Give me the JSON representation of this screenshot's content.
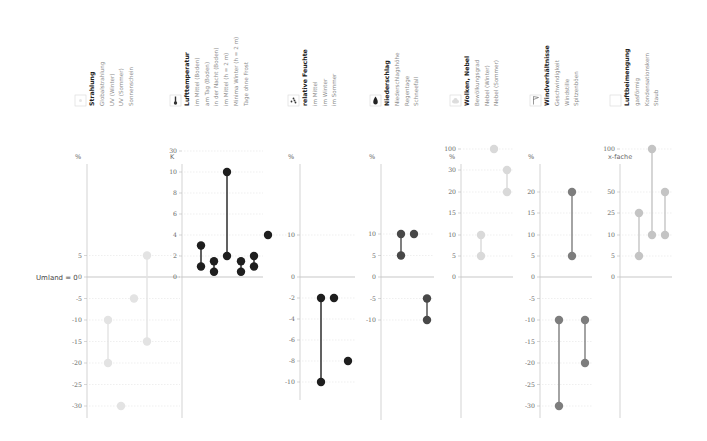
{
  "chart_data": {
    "type": "scatter",
    "baseline_label": "Umland = 0",
    "panels": [
      {
        "id": "strahlung",
        "title": "Strahlung",
        "icon": "sun-icon",
        "unit": "%",
        "color": "#e3e3e3",
        "items": [
          "Globalstrahlung",
          "UV (Winter)",
          "UV (Sommer)",
          "Sonnenschein"
        ],
        "ticks": [
          "5",
          "0",
          "-5",
          "-10",
          "-15",
          "-20",
          "-25",
          "-30"
        ],
        "tick_values": [
          5,
          0,
          -5,
          -10,
          -15,
          -20,
          -25,
          -30
        ],
        "series": [
          {
            "name": "Globalstrahlung",
            "min": -20,
            "max": -10
          },
          {
            "name": "UV (Winter)",
            "min": -30,
            "max": -30
          },
          {
            "name": "UV (Sommer)",
            "min": -5,
            "max": -5
          },
          {
            "name": "Sonnenschein",
            "min": -15,
            "max": 5
          }
        ]
      },
      {
        "id": "lufttemperatur",
        "title": "Lufttemperatur",
        "icon": "thermometer-icon",
        "unit": "K",
        "color": "#1e1e1e",
        "items": [
          "im Mittel (Boden)",
          "am Tag (Boden)",
          "in der Nacht (Boden)",
          "im Mittel (h = 2 m)",
          "Minima Winter (h = 2 m)",
          "Tage ohne Frost"
        ],
        "ticks": [
          "30",
          "10",
          "8",
          "6",
          "4",
          "2",
          "0"
        ],
        "tick_values": [
          30,
          10,
          8,
          6,
          4,
          2,
          0
        ],
        "series": [
          {
            "name": "im Mittel (Boden)",
            "min": 1,
            "max": 3
          },
          {
            "name": "am Tag (Boden)",
            "min": 0.5,
            "max": 1.5
          },
          {
            "name": "in der Nacht (Boden)",
            "min": 2,
            "max": 10
          },
          {
            "name": "im Mittel (h = 2 m)",
            "min": 0.5,
            "max": 1.5
          },
          {
            "name": "Minima Winter (h = 2 m)",
            "min": 1,
            "max": 2
          },
          {
            "name": "Tage ohne Frost (%)",
            "min": 10,
            "max": 10
          }
        ]
      },
      {
        "id": "relative-feuchte",
        "title": "relative Feuchte",
        "icon": "droplets-icon",
        "unit": "%",
        "color": "#1e1e1e",
        "items": [
          "im Mittel",
          "im Winter",
          "im Sommer"
        ],
        "ticks": [
          "10",
          "0",
          "-2",
          "-4",
          "-6",
          "-8",
          "-10"
        ],
        "tick_values": [
          10,
          0,
          -2,
          -4,
          -6,
          -8,
          -10
        ],
        "series": [
          {
            "name": "im Mittel",
            "min": -10,
            "max": -2
          },
          {
            "name": "im Winter",
            "min": -2,
            "max": -2
          },
          {
            "name": "im Sommer",
            "min": -8,
            "max": -8
          }
        ]
      },
      {
        "id": "niederschlag",
        "title": "Niederschlag",
        "icon": "raindrop-icon",
        "unit": "%",
        "color": "#484848",
        "items": [
          "Niederschlagshöhe",
          "Regentage",
          "Schneefall"
        ],
        "ticks": [
          "10",
          "5",
          "0",
          "-5",
          "-10"
        ],
        "tick_values": [
          10,
          5,
          0,
          -5,
          -10
        ],
        "series": [
          {
            "name": "Niederschlagshöhe",
            "min": 5,
            "max": 10
          },
          {
            "name": "Regentage",
            "min": 10,
            "max": 10
          },
          {
            "name": "Schneefall",
            "min": -10,
            "max": -5
          }
        ]
      },
      {
        "id": "wolken-nebel",
        "title": "Wolken, Nebel",
        "icon": "cloud-icon",
        "unit": "%",
        "color": "#d9d9d9",
        "items": [
          "Bewölkungsgrad",
          "Nebel (Winter)",
          "Nebel (Sommer)"
        ],
        "ticks": [
          "100",
          "30",
          "20",
          "15",
          "10",
          "5",
          "0"
        ],
        "tick_values": [
          100,
          30,
          20,
          15,
          10,
          5,
          0
        ],
        "series": [
          {
            "name": "Bewölkungsgrad",
            "min": 5,
            "max": 10
          },
          {
            "name": "Nebel (Winter)",
            "min": 100,
            "max": 100
          },
          {
            "name": "Nebel (Sommer)",
            "min": 20,
            "max": 30
          }
        ]
      },
      {
        "id": "windverhaeltnisse",
        "title": "Windverhältnisse",
        "icon": "flag-icon",
        "unit": "%",
        "color": "#7d7d7d",
        "items": [
          "Geschwindigkeit",
          "Windstille",
          "Spitzenböen"
        ],
        "ticks": [
          "20",
          "15",
          "10",
          "5",
          "0",
          "-5",
          "-10",
          "-15",
          "-20",
          "-25",
          "-30"
        ],
        "tick_values": [
          20,
          15,
          10,
          5,
          0,
          -5,
          -10,
          -15,
          -20,
          -25,
          -30
        ],
        "series": [
          {
            "name": "Geschwindigkeit",
            "min": -30,
            "max": -10
          },
          {
            "name": "Windstille",
            "min": 5,
            "max": 20
          },
          {
            "name": "Spitzenböen",
            "min": -20,
            "max": -10
          }
        ]
      },
      {
        "id": "luftbeimengung",
        "title": "Luftbeimengung",
        "icon": "particles-icon",
        "unit": "x-fache",
        "color": "#c4c4c4",
        "items": [
          "gasförmig",
          "Kondensationskern",
          "Staub"
        ],
        "ticks": [
          "100",
          "50",
          "25",
          "10",
          "5",
          "0"
        ],
        "tick_values": [
          100,
          50,
          25,
          10,
          5,
          0
        ],
        "series": [
          {
            "name": "gasförmig",
            "min": 5,
            "max": 25
          },
          {
            "name": "Kondensationskern",
            "min": 10,
            "max": 100
          },
          {
            "name": "Staub",
            "min": 10,
            "max": 50
          }
        ]
      }
    ]
  }
}
